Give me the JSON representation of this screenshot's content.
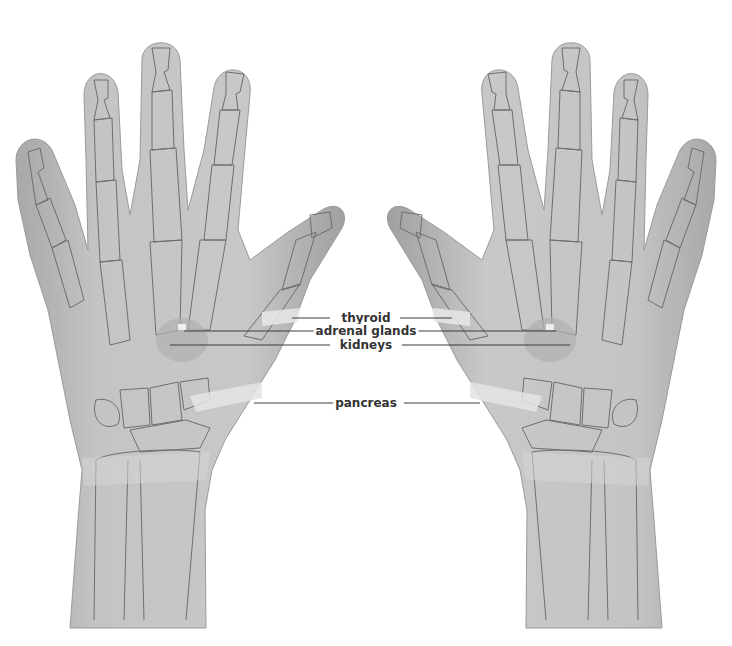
{
  "diagram": {
    "hands": [
      "left-hand",
      "right-hand"
    ],
    "colors": {
      "skin": "#bdbdbd",
      "skin_light": "#d2d2d2",
      "bone_line": "#6e6e6e",
      "highlight": "#e6e6e6",
      "leader": "#3a3a3a",
      "text": "#333333"
    },
    "labels": [
      {
        "id": "thyroid",
        "text": "thyroid",
        "x": 366,
        "y": 318
      },
      {
        "id": "adrenal-glands",
        "text": "adrenal glands",
        "x": 366,
        "y": 331
      },
      {
        "id": "kidneys",
        "text": "kidneys",
        "x": 366,
        "y": 345
      },
      {
        "id": "pancreas",
        "text": "pancreas",
        "x": 366,
        "y": 403
      }
    ]
  }
}
